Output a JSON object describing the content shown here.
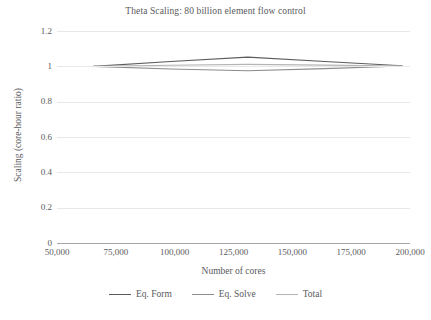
{
  "chart_data": {
    "type": "line",
    "title": "Theta Scaling: 80 billion element flow control",
    "xlabel": "Number of cores",
    "ylabel": "Scaling (core-hour ratio)",
    "xlim": [
      50000,
      200000
    ],
    "ylim": [
      0,
      1.2
    ],
    "grid": true,
    "legend_position": "bottom",
    "x_ticks": [
      "50,000",
      "75,000",
      "100,000",
      "125,000",
      "150,000",
      "175,000",
      "200,000"
    ],
    "x_tick_values": [
      50000,
      75000,
      100000,
      125000,
      150000,
      175000,
      200000
    ],
    "y_ticks": [
      "0",
      "0.2",
      "0.4",
      "0.6",
      "0.8",
      "1",
      "1.2"
    ],
    "y_tick_values": [
      0,
      0.2,
      0.4,
      0.6,
      0.8,
      1,
      1.2
    ],
    "x": [
      65536,
      98304,
      131072,
      163840,
      196608
    ],
    "series": [
      {
        "name": "Eq. Form",
        "color": "#5c5c5e",
        "values": [
          1.0,
          1.027,
          1.052,
          1.027,
          1.003
        ]
      },
      {
        "name": "Eq. Solve",
        "color": "#8c8c8e",
        "values": [
          1.0,
          0.985,
          0.975,
          0.987,
          1.002
        ]
      },
      {
        "name": "Total",
        "color": "#b4b4b6",
        "values": [
          1.0,
          1.006,
          1.011,
          1.007,
          1.002
        ]
      }
    ]
  },
  "legend": {
    "items": [
      {
        "label": "Eq. Form"
      },
      {
        "label": "Eq. Solve"
      },
      {
        "label": "Total"
      }
    ]
  }
}
